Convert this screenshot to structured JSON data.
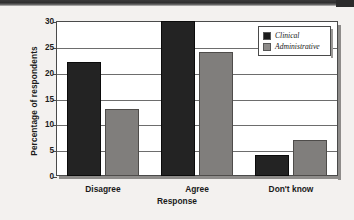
{
  "chart_data": {
    "type": "bar",
    "title": "",
    "xlabel": "Response",
    "ylabel": "Percentage of respondents",
    "categories": [
      "Disagree",
      "Agree",
      "Don't know"
    ],
    "series": [
      {
        "name": "Clinical",
        "values": [
          22,
          30,
          4
        ],
        "color": "#232323"
      },
      {
        "name": "Administrative",
        "values": [
          13,
          24,
          7
        ],
        "color": "#807e7c"
      }
    ],
    "ylim": [
      0,
      30
    ],
    "yticks": [
      0,
      5,
      10,
      15,
      20,
      25,
      30
    ],
    "ytick_labels": [
      "0",
      "5",
      "10",
      "15",
      "20",
      "25",
      "30"
    ],
    "grid": true,
    "grid_axis": "y",
    "legend_position": "top-right",
    "legend_entries": [
      "Clinical",
      "Administrative"
    ]
  },
  "legend": {
    "items": [
      {
        "label": "Clinical",
        "swatch": "black-square-swatch"
      },
      {
        "label": "Administrative",
        "swatch": "gray-square-swatch"
      }
    ]
  },
  "axes": {
    "y_title": "Percentage of respondents",
    "x_title": "Response"
  }
}
